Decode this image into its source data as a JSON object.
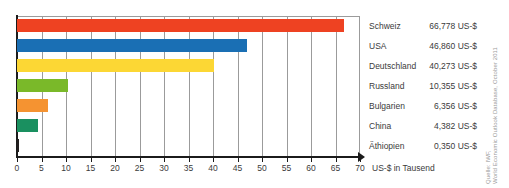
{
  "chart_data": {
    "type": "bar",
    "orientation": "horizontal",
    "title": "",
    "xlabel": "US-$ in Tausend",
    "ylabel": "",
    "xlim": [
      0,
      70
    ],
    "xticks": [
      0,
      5,
      10,
      15,
      20,
      25,
      30,
      35,
      40,
      45,
      50,
      55,
      60,
      65,
      70
    ],
    "grid": true,
    "legend_position": "right",
    "categories": [
      "Schweiz",
      "USA",
      "Deutschland",
      "Russland",
      "Bulgarien",
      "China",
      "Äthiopien"
    ],
    "values": [
      66.778,
      46.86,
      40.273,
      10.355,
      6.356,
      4.382,
      0.35
    ],
    "value_labels": [
      "66,778 US-$",
      "46,860 US-$",
      "40,273 US-$",
      "10,355 US-$",
      "6,356 US-$",
      "4,382 US-$",
      "0,350 US-$"
    ],
    "colors": [
      "#ee4222",
      "#1a6fb4",
      "#fcd734",
      "#7ab929",
      "#f59331",
      "#1a9060",
      "#221f1f"
    ],
    "unit": "US-$",
    "value_scale": "Tausend"
  },
  "axis": {
    "tick_labels": [
      "0",
      "5",
      "10",
      "15",
      "20",
      "25",
      "30",
      "35",
      "40",
      "45",
      "50",
      "55",
      "60",
      "65",
      "70"
    ],
    "title": "US-$ in Tausend"
  },
  "legend": {
    "rows": [
      {
        "name": "Schweiz",
        "value": "66,778 US-$"
      },
      {
        "name": "USA",
        "value": "46,860 US-$"
      },
      {
        "name": "Deutschland",
        "value": "40,273 US-$"
      },
      {
        "name": "Russland",
        "value": "10,355 US-$"
      },
      {
        "name": "Bulgarien",
        "value": "6,356 US-$"
      },
      {
        "name": "China",
        "value": "4,382 US-$"
      },
      {
        "name": "Äthiopien",
        "value": "0,350 US-$"
      }
    ]
  },
  "source": {
    "lines": [
      "Quelle: IWF,",
      "World Economic Outlook Database, October 2011"
    ]
  }
}
